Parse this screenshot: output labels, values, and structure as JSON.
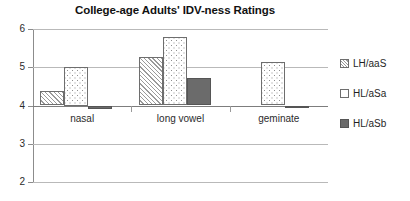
{
  "chart_data": {
    "type": "bar",
    "title": "College-age Adults' IDV-ness Ratings",
    "xlabel": "",
    "ylabel": "",
    "categories": [
      "nasal",
      "long vowel",
      "geminate"
    ],
    "series": [
      {
        "name": "LH/aaS",
        "values": [
          4.38,
          5.27,
          4.0
        ],
        "pattern": "diagonal-hatch",
        "color": "#ffffff"
      },
      {
        "name": "HL/aSa",
        "values": [
          5.0,
          5.78,
          5.14
        ],
        "pattern": "dotted",
        "color": "#ffffff"
      },
      {
        "name": "HL/aSb",
        "values": [
          3.9,
          4.72,
          3.98
        ],
        "pattern": "solid",
        "color": "#6b6b6b"
      }
    ],
    "ylim": [
      2,
      6
    ],
    "yticks": [
      6,
      5,
      4,
      3,
      2
    ],
    "ytick_labels": [
      "6",
      "5",
      "4",
      "3",
      "2"
    ],
    "baseline": 4,
    "grid": true,
    "legend_position": "right"
  },
  "legend": {
    "items": [
      {
        "label": "LH/aaS"
      },
      {
        "label": "HL/aSa"
      },
      {
        "label": "HL/aSb"
      }
    ]
  }
}
